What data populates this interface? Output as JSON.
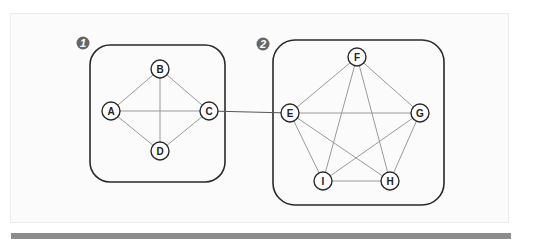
{
  "diagram": {
    "colors": {
      "box_stroke": "#2a2a2a",
      "edge": "#9a9a9a",
      "bridge": "#555555",
      "node_fill": "#ffffff",
      "node_stroke": "#2a2a2a",
      "badge_fill": "#666666"
    },
    "groups": [
      {
        "id": "group-1",
        "badge": "1",
        "badge_pos": [
          83,
          43
        ],
        "box": {
          "x": 90,
          "y": 45,
          "w": 135,
          "h": 137,
          "r": 20
        }
      },
      {
        "id": "group-2",
        "badge": "2",
        "badge_pos": [
          263,
          44
        ],
        "box": {
          "x": 273,
          "y": 40,
          "w": 171,
          "h": 165,
          "r": 22
        }
      }
    ],
    "nodes": [
      {
        "id": "A",
        "label": "A",
        "x": 111,
        "y": 111
      },
      {
        "id": "B",
        "label": "B",
        "x": 160,
        "y": 69
      },
      {
        "id": "C",
        "label": "C",
        "x": 209,
        "y": 111
      },
      {
        "id": "D",
        "label": "D",
        "x": 160,
        "y": 151
      },
      {
        "id": "E",
        "label": "E",
        "x": 290,
        "y": 113
      },
      {
        "id": "F",
        "label": "F",
        "x": 357,
        "y": 57
      },
      {
        "id": "G",
        "label": "G",
        "x": 420,
        "y": 113
      },
      {
        "id": "H",
        "label": "H",
        "x": 390,
        "y": 181
      },
      {
        "id": "I",
        "label": "I",
        "x": 323,
        "y": 181
      }
    ],
    "edges": [
      [
        "A",
        "B"
      ],
      [
        "A",
        "C"
      ],
      [
        "A",
        "D"
      ],
      [
        "B",
        "C"
      ],
      [
        "B",
        "D"
      ],
      [
        "C",
        "D"
      ],
      [
        "E",
        "F"
      ],
      [
        "E",
        "G"
      ],
      [
        "E",
        "H"
      ],
      [
        "E",
        "I"
      ],
      [
        "F",
        "G"
      ],
      [
        "F",
        "H"
      ],
      [
        "F",
        "I"
      ],
      [
        "G",
        "H"
      ],
      [
        "G",
        "I"
      ],
      [
        "H",
        "I"
      ]
    ],
    "bridge_edges": [
      [
        "C",
        "E"
      ]
    ],
    "node_radius": 9
  }
}
